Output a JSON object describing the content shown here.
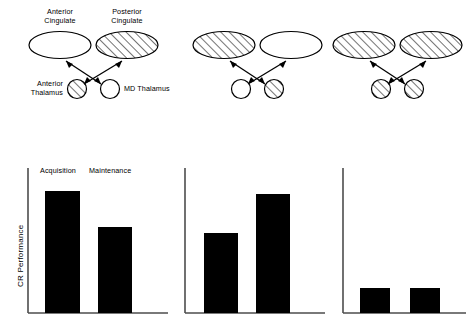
{
  "figure": {
    "background": "#ffffff",
    "ink": "#000000",
    "bar_fill": "#000000",
    "axis_color": "#4d4d4d",
    "hatch_color": "#000000",
    "width": 476,
    "height": 327
  },
  "diagrams": [
    {
      "id": "diagram-1",
      "labels": {
        "top_left": "Anterior\nCingulate",
        "top_right": "Posterior\nCingulate",
        "bottom_left": "Anterior\nThalamus",
        "bottom_right": "MD Thalamus"
      },
      "top_left_label_line1": "Anterior",
      "top_left_label_line2": "Cingulate",
      "top_right_label_line1": "Posterior",
      "top_right_label_line2": "Cingulate",
      "bottom_left_label_line1": "Anterior",
      "bottom_left_label_line2": "Thalamus",
      "bottom_right_label": "MD Thalamus",
      "nodes": {
        "anterior_cingulate": {
          "shape": "ellipse",
          "fill": "open"
        },
        "posterior_cingulate": {
          "shape": "ellipse",
          "fill": "hatched"
        },
        "anterior_thalamus": {
          "shape": "circle",
          "fill": "hatched"
        },
        "md_thalamus": {
          "shape": "circle",
          "fill": "open"
        }
      },
      "connections": "crossed-bidirectional"
    },
    {
      "id": "diagram-2",
      "nodes": {
        "anterior_cingulate": {
          "shape": "ellipse",
          "fill": "hatched"
        },
        "posterior_cingulate": {
          "shape": "ellipse",
          "fill": "open"
        },
        "anterior_thalamus": {
          "shape": "circle",
          "fill": "open"
        },
        "md_thalamus": {
          "shape": "circle",
          "fill": "hatched"
        }
      },
      "connections": "crossed-bidirectional"
    },
    {
      "id": "diagram-3",
      "nodes": {
        "anterior_cingulate": {
          "shape": "ellipse",
          "fill": "hatched"
        },
        "posterior_cingulate": {
          "shape": "ellipse",
          "fill": "hatched"
        },
        "anterior_thalamus": {
          "shape": "circle",
          "fill": "hatched"
        },
        "md_thalamus": {
          "shape": "circle",
          "fill": "hatched"
        }
      },
      "connections": "crossed-bidirectional"
    }
  ],
  "axis_label": "CR Performance",
  "chart_data": [
    {
      "type": "bar",
      "id": "chart-1",
      "title": "",
      "xlabel": "",
      "ylabel": "CR Performance",
      "categories": [
        "Acquisition",
        "Maintenance"
      ],
      "values": [
        84,
        59
      ],
      "ylim": [
        0,
        100
      ],
      "grid": false,
      "legend": "none",
      "bar_labels_position": "above-axis-top"
    },
    {
      "type": "bar",
      "id": "chart-2",
      "title": "",
      "xlabel": "",
      "ylabel": "",
      "categories": [
        "Acquisition",
        "Maintenance"
      ],
      "values": [
        55,
        82
      ],
      "ylim": [
        0,
        100
      ],
      "grid": false,
      "legend": "none"
    },
    {
      "type": "bar",
      "id": "chart-3",
      "title": "",
      "xlabel": "",
      "ylabel": "",
      "categories": [
        "Acquisition",
        "Maintenance"
      ],
      "values": [
        17,
        17
      ],
      "ylim": [
        0,
        100
      ],
      "grid": false,
      "legend": "none"
    }
  ]
}
